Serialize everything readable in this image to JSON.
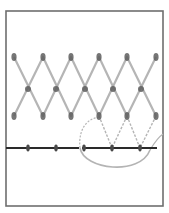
{
  "diagram": {
    "canvas": {
      "width": 169,
      "height": 213,
      "background": "#ffffff"
    },
    "frame": {
      "x": 6,
      "y": 11,
      "width": 157,
      "height": 195,
      "stroke": "#6e6e6e"
    },
    "colors": {
      "strand": "#a8a8a8",
      "strand_node": "#5e5e5e",
      "baseline": "#2a2a2a",
      "baseline_node": "#4a4a4a",
      "loop": "#b4b4b4"
    },
    "peaks": [
      {
        "x": 14,
        "y": 57
      },
      {
        "x": 43,
        "y": 57
      },
      {
        "x": 71,
        "y": 57
      },
      {
        "x": 99,
        "y": 57
      },
      {
        "x": 127,
        "y": 57
      },
      {
        "x": 156,
        "y": 57
      }
    ],
    "valleys": [
      {
        "x": 14,
        "y": 116
      },
      {
        "x": 43,
        "y": 116
      },
      {
        "x": 71,
        "y": 116
      },
      {
        "x": 99,
        "y": 116
      },
      {
        "x": 127,
        "y": 116
      },
      {
        "x": 156,
        "y": 116
      }
    ],
    "crossings": [
      {
        "x": 28,
        "y": 89
      },
      {
        "x": 56,
        "y": 89
      },
      {
        "x": 85,
        "y": 89
      },
      {
        "x": 113,
        "y": 89
      },
      {
        "x": 141,
        "y": 89
      }
    ],
    "baseline": {
      "segments": [
        {
          "x1": 6,
          "x2": 79
        },
        {
          "x1": 82,
          "x2": 157
        }
      ],
      "y": 148,
      "nodes": [
        {
          "x": 28
        },
        {
          "x": 56
        },
        {
          "x": 84
        },
        {
          "x": 112
        },
        {
          "x": 140
        }
      ]
    },
    "drop_links": [
      {
        "from": {
          "x": 99,
          "y": 116
        },
        "to": {
          "x": 112,
          "y": 148
        }
      },
      {
        "from": {
          "x": 127,
          "y": 116
        },
        "to": {
          "x": 112,
          "y": 148
        }
      },
      {
        "from": {
          "x": 127,
          "y": 116
        },
        "to": {
          "x": 140,
          "y": 148
        }
      },
      {
        "from": {
          "x": 156,
          "y": 116
        },
        "to": {
          "x": 140,
          "y": 148
        }
      }
    ],
    "loop": {
      "lower_arc": "M 80 148 C 84 170, 140 176, 150 150",
      "upper_arc": "M 80 148 C 78 128, 88 118, 100 117",
      "tail": "M 150 150 C 156 140, 160 136, 163 134"
    }
  }
}
